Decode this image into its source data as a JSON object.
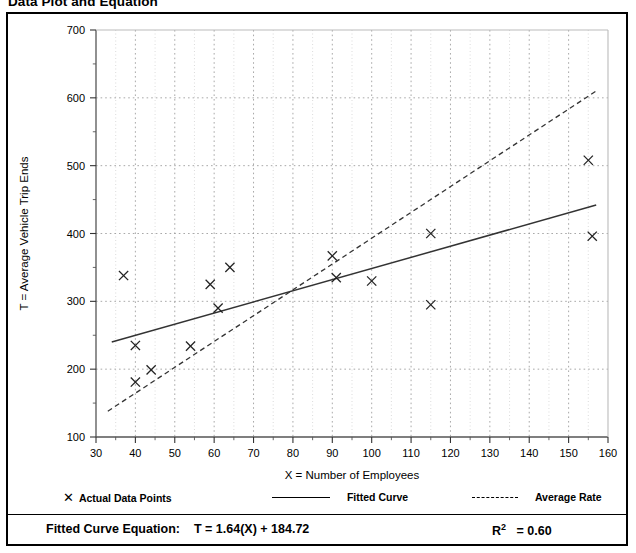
{
  "figure": {
    "title": "Data Plot and Equation"
  },
  "legend": {
    "items": [
      {
        "label": "Actual Data Points",
        "marker": "x-marker-icon"
      },
      {
        "label": "Fitted Curve",
        "marker": "solid-line-icon"
      },
      {
        "label": "Average Rate",
        "marker": "dashed-line-icon"
      }
    ]
  },
  "equation": {
    "prefix": "Fitted Curve Equation:",
    "formula": "T = 1.64(X) + 184.72",
    "r2_label": "R",
    "r2_sup": "2",
    "r2_value": "= 0.60",
    "r2_full": "R2 = 0.60"
  },
  "chart_data": {
    "type": "scatter",
    "title": "Data Plot and Equation",
    "xlabel": "X = Number of Employees",
    "ylabel": "T = Average Vehicle Trip Ends",
    "xlim": [
      30,
      160
    ],
    "ylim": [
      100,
      700
    ],
    "xticks": [
      30,
      40,
      50,
      60,
      70,
      80,
      90,
      100,
      110,
      120,
      130,
      140,
      150,
      160
    ],
    "yticks": [
      100,
      200,
      300,
      400,
      500,
      600,
      700
    ],
    "xtick_labels": [
      "30",
      "40",
      "50",
      "60",
      "70",
      "80",
      "90",
      "100",
      "110",
      "120",
      "130",
      "140",
      "150",
      "160"
    ],
    "ytick_labels": [
      "100",
      "200",
      "300",
      "400",
      "500",
      "600",
      "700"
    ],
    "minor_xticks_step": 5,
    "minor_yticks_step": 50,
    "grid": true,
    "grid_style": "dotted",
    "legend_position": "below-axes",
    "series": [
      {
        "name": "Actual Data Points",
        "type": "scatter",
        "marker": "x",
        "points": [
          [
            37,
            338
          ],
          [
            40,
            235
          ],
          [
            40,
            181
          ],
          [
            44,
            199
          ],
          [
            54,
            234
          ],
          [
            59,
            325
          ],
          [
            61,
            290
          ],
          [
            64,
            350
          ],
          [
            90,
            367
          ],
          [
            91,
            335
          ],
          [
            100,
            330
          ],
          [
            115,
            400
          ],
          [
            115,
            295
          ],
          [
            155,
            508
          ],
          [
            156,
            396
          ]
        ]
      },
      {
        "name": "Fitted Curve",
        "type": "line",
        "style": "solid",
        "equation": "T = 1.64(X) + 184.72",
        "slope": 1.64,
        "intercept": 184.72,
        "r_squared": 0.6,
        "endpoints": [
          [
            34,
            240
          ],
          [
            157,
            442
          ]
        ]
      },
      {
        "name": "Average Rate",
        "type": "line",
        "style": "dashed",
        "endpoints": [
          [
            33,
            138
          ],
          [
            157,
            610
          ]
        ]
      }
    ]
  }
}
